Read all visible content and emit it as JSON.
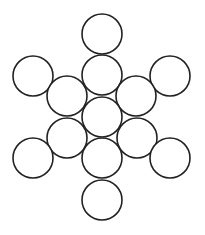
{
  "diagram": {
    "stroke_color": "#222222",
    "fill_color": "#ffffff",
    "background": "#ffffff",
    "radius": 20,
    "circles": [
      {
        "id": "top",
        "cx": 102,
        "cy": 34
      },
      {
        "id": "upper-center",
        "cx": 102,
        "cy": 75
      },
      {
        "id": "upper-left-outer",
        "cx": 33,
        "cy": 76
      },
      {
        "id": "upper-right-outer",
        "cx": 170,
        "cy": 76
      },
      {
        "id": "upper-left-inner",
        "cx": 67,
        "cy": 96
      },
      {
        "id": "upper-right-inner",
        "cx": 136,
        "cy": 96
      },
      {
        "id": "center",
        "cx": 102,
        "cy": 117
      },
      {
        "id": "lower-left-inner",
        "cx": 67,
        "cy": 138
      },
      {
        "id": "lower-right-inner",
        "cx": 137,
        "cy": 138
      },
      {
        "id": "lower-left-outer",
        "cx": 33,
        "cy": 158
      },
      {
        "id": "lower-right-outer",
        "cx": 170,
        "cy": 158
      },
      {
        "id": "lower-center",
        "cx": 102,
        "cy": 158
      },
      {
        "id": "bottom",
        "cx": 102,
        "cy": 200
      }
    ]
  }
}
